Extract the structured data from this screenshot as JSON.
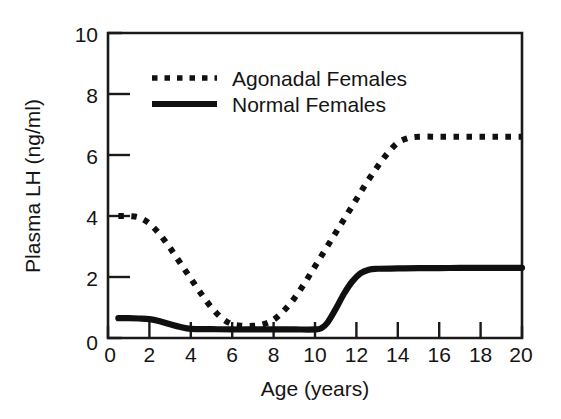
{
  "chart_data": {
    "type": "line",
    "title": "",
    "xlabel": "Age (years)",
    "ylabel": "Plasma LH (ng/ml)",
    "xlim": [
      0,
      20
    ],
    "ylim": [
      0,
      10
    ],
    "xticks": [
      "0",
      "2",
      "4",
      "6",
      "8",
      "10",
      "12",
      "14",
      "16",
      "18",
      "20"
    ],
    "yticks": [
      "0",
      "2",
      "4",
      "6",
      "8",
      "10"
    ],
    "grid": false,
    "legend_position": "upper-left-inside",
    "series": [
      {
        "name": "Agonadal Females",
        "style": "dotted",
        "color": "#101010",
        "x": [
          0.5,
          1.0,
          1.5,
          2.0,
          2.5,
          3.0,
          3.5,
          4.0,
          4.5,
          5.0,
          5.5,
          6.0,
          6.5,
          7.0,
          7.5,
          8.0,
          8.5,
          9.0,
          9.5,
          10.0,
          10.5,
          11.0,
          11.5,
          12.0,
          12.5,
          13.0,
          13.5,
          14.0,
          14.5,
          15.0,
          16.0,
          17.0,
          18.0,
          19.0,
          20.0
        ],
        "values": [
          4.0,
          4.0,
          3.95,
          3.75,
          3.4,
          2.95,
          2.45,
          1.95,
          1.45,
          1.0,
          0.65,
          0.45,
          0.4,
          0.4,
          0.45,
          0.6,
          0.9,
          1.3,
          1.8,
          2.35,
          2.9,
          3.45,
          4.0,
          4.55,
          5.1,
          5.6,
          6.05,
          6.4,
          6.55,
          6.6,
          6.6,
          6.6,
          6.6,
          6.6,
          6.6
        ]
      },
      {
        "name": "Normal Females",
        "style": "solid",
        "color": "#101010",
        "x": [
          0.5,
          1.0,
          1.5,
          2.0,
          2.5,
          3.0,
          3.5,
          4.0,
          5.0,
          6.0,
          7.0,
          8.0,
          9.0,
          10.0,
          10.3,
          10.6,
          11.0,
          11.4,
          11.8,
          12.2,
          12.6,
          13.0,
          14.0,
          15.0,
          16.0,
          17.0,
          18.0,
          19.0,
          20.0
        ],
        "values": [
          0.65,
          0.65,
          0.64,
          0.62,
          0.55,
          0.45,
          0.36,
          0.3,
          0.29,
          0.28,
          0.28,
          0.28,
          0.28,
          0.28,
          0.32,
          0.5,
          0.95,
          1.45,
          1.85,
          2.12,
          2.24,
          2.27,
          2.28,
          2.29,
          2.29,
          2.3,
          2.3,
          2.3,
          2.3
        ]
      }
    ]
  },
  "axes": {
    "y_title": "Plasma LH (ng/ml)",
    "x_title": "Age (years)",
    "y_tick_labels": [
      "10",
      "8",
      "6",
      "4",
      "2",
      "0"
    ],
    "x_tick_labels": [
      "0",
      "2",
      "4",
      "6",
      "8",
      "10",
      "12",
      "14",
      "16",
      "18",
      "20"
    ]
  },
  "legend": {
    "entries": [
      {
        "label": "Agonadal Females",
        "style": "dotted"
      },
      {
        "label": "Normal Females",
        "style": "solid"
      }
    ]
  },
  "colors": {
    "ink": "#101010",
    "background": "#ffffff"
  }
}
